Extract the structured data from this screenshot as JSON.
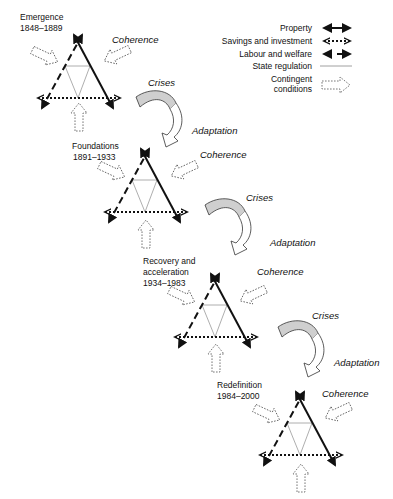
{
  "legend": {
    "items": [
      {
        "label": "Property",
        "style": "solid-thick-double-arrow"
      },
      {
        "label": "Savings and investment",
        "style": "dotted-double-arrow"
      },
      {
        "label": "Labour and welfare",
        "style": "dashed-double-arrow"
      },
      {
        "label": "State regulation",
        "style": "thin-line"
      },
      {
        "label_line1": "Contingent",
        "label_line2": "conditions",
        "style": "dashed-outline-block-arrow"
      }
    ]
  },
  "stages": [
    {
      "name_line1": "Emergence",
      "name_line2": "1848–1889",
      "coherence": "Coherence"
    },
    {
      "name_line1": "Foundations",
      "name_line2": "1891–1933",
      "coherence": "Coherence"
    },
    {
      "name_line1": "Recovery and",
      "name_line2": "acceleration",
      "name_line3": "1934–1983",
      "coherence": "Coherence"
    },
    {
      "name_line1": "Redefinition",
      "name_line2": "1984–2000",
      "coherence": "Coherence"
    }
  ],
  "transitions": [
    {
      "crises": "Crises",
      "adaptation": "Adaptation"
    },
    {
      "crises": "Crises",
      "adaptation": "Adaptation"
    },
    {
      "crises": "Crises",
      "adaptation": "Adaptation"
    }
  ],
  "colors": {
    "line": "#111111",
    "regulation": "#999999",
    "crises_fill": "#cfcfcf",
    "contingent": "#666666"
  }
}
